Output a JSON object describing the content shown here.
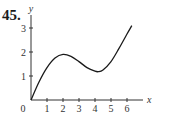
{
  "problem_number": "45.",
  "chart_data": {
    "type": "line",
    "title": "",
    "xlabel": "x",
    "ylabel": "y",
    "x_ticks": [
      1,
      2,
      3,
      4,
      5,
      6
    ],
    "y_ticks": [
      1,
      2,
      3
    ],
    "origin_label": "0",
    "xlim": [
      0,
      7
    ],
    "ylim": [
      0,
      3.5
    ],
    "grid": false,
    "legend": null,
    "series": [
      {
        "name": "f(x)",
        "x": [
          0,
          0.5,
          1,
          1.5,
          2,
          2.5,
          3,
          3.5,
          4,
          4.2,
          4.5,
          5,
          5.5,
          6,
          6.3
        ],
        "y": [
          0,
          0.75,
          1.35,
          1.75,
          1.9,
          1.82,
          1.6,
          1.35,
          1.2,
          1.18,
          1.25,
          1.6,
          2.15,
          2.75,
          3.1
        ]
      }
    ],
    "annotations": [
      "local max near (2, 1.9)",
      "local min near (4.2, 1.2)"
    ]
  },
  "colors": {
    "axis": "#333333",
    "curve": "#1a1a1a"
  }
}
